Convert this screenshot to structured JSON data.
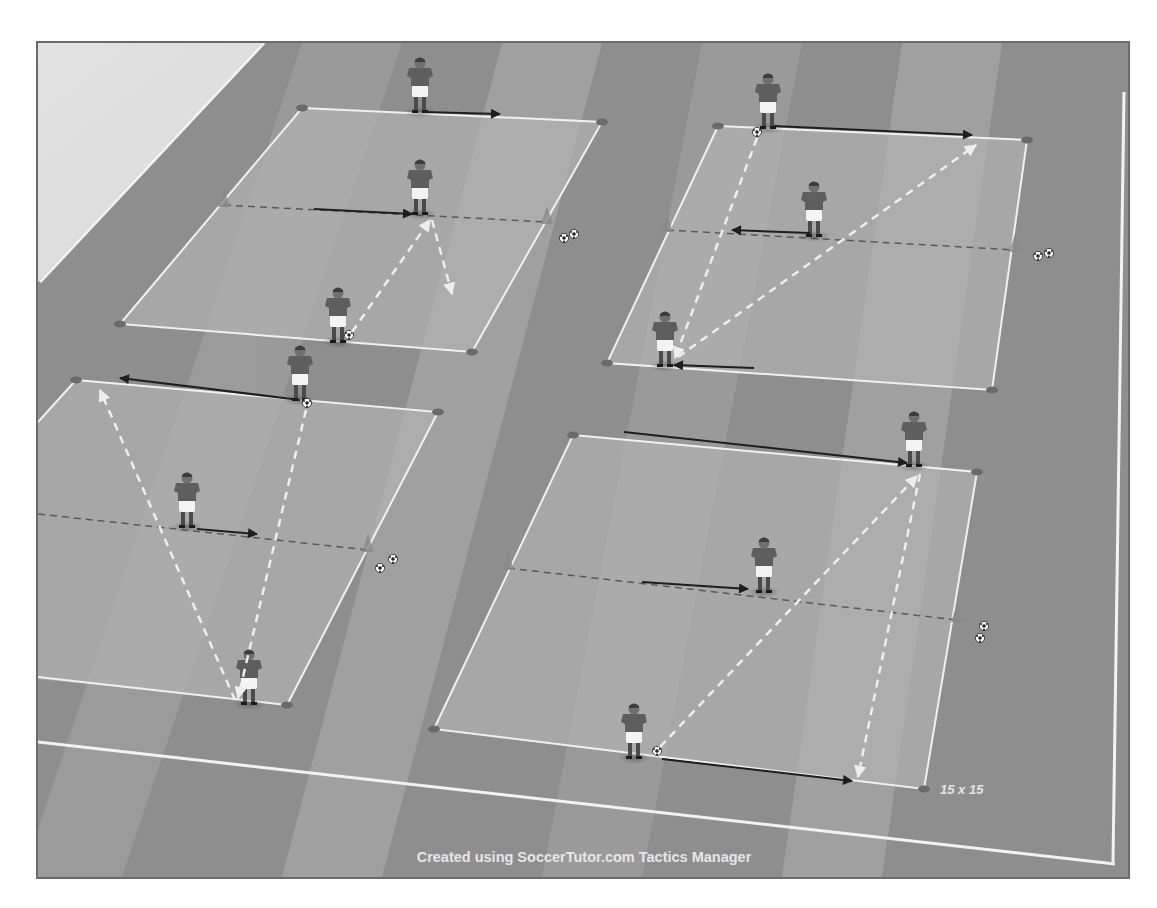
{
  "diagram": {
    "type": "soccer-training-drill",
    "colors": {
      "outside_area": "#d6d6d6",
      "pitch_dark": "#8e8e8e",
      "pitch_light": "#a9a9a9",
      "grid_fill": "#b0b0b0",
      "line_white": "#f2f2f2",
      "player_shirt": "#5e5e5e",
      "player_shorts": "#f4f4f4",
      "run_arrow": "#1e1e1e",
      "pass_arrow": "#eeeeee",
      "divider_dash": "#5a5a5a",
      "cone": "#6a6a6a",
      "frame": "#6b6b6b"
    },
    "grid_size_label": "15 x 15",
    "credit": "Created using SoccerTutor.com Tactics Manager",
    "grids": [
      {
        "id": "top-left",
        "players": 3,
        "ball_stacks": 1
      },
      {
        "id": "bottom-left",
        "players": 3,
        "ball_stacks": 1
      },
      {
        "id": "top-right",
        "players": 3,
        "ball_stacks": 1
      },
      {
        "id": "bottom-right",
        "players": 3,
        "ball_stacks": 1
      }
    ],
    "legend": {
      "solid_black_arrow": "player movement",
      "dashed_white_arrow": "pass",
      "dashed_dark_line": "middle dividing line"
    }
  }
}
